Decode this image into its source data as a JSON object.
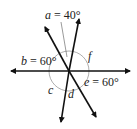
{
  "diagram": {
    "type": "intersecting-lines-angles",
    "labels": {
      "a": {
        "var": "a",
        "eq": " = ",
        "val": "40°"
      },
      "b": {
        "var": "b",
        "eq": " = ",
        "val": "60°"
      },
      "c": {
        "var": "c"
      },
      "d": {
        "var": "d"
      },
      "e": {
        "var": "e",
        "eq": " = ",
        "val": "60°"
      },
      "f": {
        "var": "f"
      }
    }
  }
}
